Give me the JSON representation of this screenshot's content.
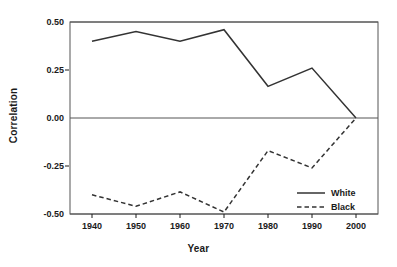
{
  "chart_data": {
    "type": "line",
    "title": "",
    "xlabel": "Year",
    "ylabel": "Correlation",
    "x": [
      1940,
      1950,
      1960,
      1970,
      1980,
      1990,
      2000
    ],
    "categories": [
      "1940",
      "1950",
      "1960",
      "1970",
      "1980",
      "1990",
      "2000"
    ],
    "xlim": [
      1935,
      2005
    ],
    "ylim": [
      -0.5,
      0.5
    ],
    "yticks": [
      0.5,
      0.25,
      0.0,
      -0.25,
      -0.5
    ],
    "ytick_labels": [
      "0.50",
      "0.25",
      "0.00",
      "-0.25",
      "-0.50"
    ],
    "xticks": [
      1940,
      1950,
      1960,
      1970,
      1980,
      1990,
      2000
    ],
    "xtick_labels": [
      "1940",
      "1950",
      "1960",
      "1970",
      "1980",
      "1990",
      "2000"
    ],
    "grid": false,
    "gridlines_shown": [
      "0.50",
      "0.00",
      "-0.50"
    ],
    "legend_position": "bottom-right",
    "series": [
      {
        "name": "White",
        "style": "solid",
        "color": "#333333",
        "values": [
          0.4,
          0.45,
          0.4,
          0.46,
          0.165,
          0.26,
          0.0
        ]
      },
      {
        "name": "Black",
        "style": "dashed",
        "color": "#333333",
        "values": [
          -0.4,
          -0.46,
          -0.385,
          -0.49,
          -0.17,
          -0.26,
          0.0
        ]
      }
    ]
  },
  "axis": {
    "ylabel": "Correlation",
    "xlabel": "Year"
  },
  "legend": {
    "items": [
      {
        "label": "White",
        "style": "solid"
      },
      {
        "label": "Black",
        "style": "dashed"
      }
    ]
  },
  "colors": {
    "line": "#333333",
    "frame": "#555555",
    "text": "#1a1a1a",
    "background": "#ffffff"
  }
}
